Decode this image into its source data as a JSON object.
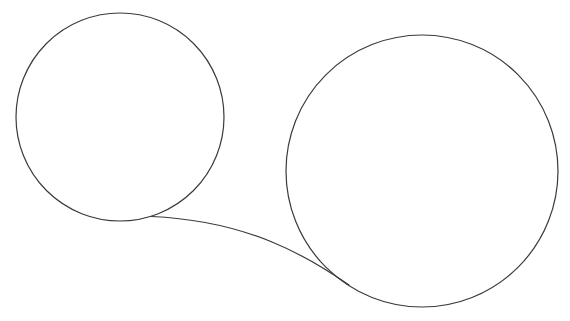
{
  "figure": {
    "title": "Two connected circles line drawing",
    "canvas_width": 570,
    "canvas_height": 321,
    "background_color": "#ffffff",
    "stroke_color": "#3a3a3a",
    "stroke_width": 1.2
  },
  "shapes": [
    {
      "name": "left-circle",
      "type": "circle",
      "center_x": 120,
      "center_y": 117,
      "radius": 104,
      "bounds": {
        "left": 16,
        "top": 13,
        "right": 224,
        "bottom": 221
      },
      "fill": "none",
      "stroke": "#3a3a3a"
    },
    {
      "name": "right-circle",
      "type": "circle",
      "center_x": 422,
      "center_y": 171,
      "radius": 136,
      "bounds": {
        "left": 286,
        "top": 35,
        "right": 558,
        "bottom": 307
      },
      "fill": "none",
      "stroke": "#3a3a3a"
    },
    {
      "name": "connector-curve",
      "type": "path",
      "path": "M 151.5 216.5 C 196 218.5, 238 228, 272 242 C 300 253.5, 326 269, 349 285",
      "start_point": {
        "x": 151.5,
        "y": 216.5
      },
      "end_point": {
        "x": 349,
        "y": 285
      },
      "crossing_point": {
        "x": 318,
        "y": 261
      },
      "fill": "none",
      "stroke": "#3a3a3a"
    }
  ]
}
